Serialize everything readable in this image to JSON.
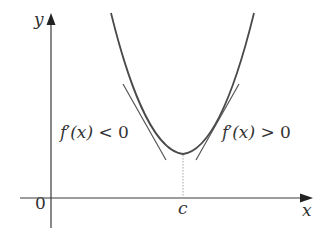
{
  "diagram": {
    "title": "",
    "axes": {
      "x_label": "x",
      "y_label": "y",
      "origin_label": "0",
      "x_tick_label": "c"
    },
    "annotations": {
      "left_region": {
        "prefix": "f",
        "prime": "′",
        "arg": "(x)",
        "relation": " < ",
        "value": "0"
      },
      "right_region": {
        "prefix": "f",
        "prime": "′",
        "arg": "(x)",
        "relation": " > ",
        "value": "0"
      }
    },
    "curve": {
      "description": "upward-opening parabola with minimum at x = c",
      "stroke_color": "#4a4a4a"
    },
    "tangent_lines": [
      {
        "side": "left",
        "slope_sign": "negative"
      },
      {
        "side": "right",
        "slope_sign": "positive"
      }
    ],
    "colors": {
      "axis": "#3a3a3a",
      "curve": "#4a4a4a",
      "tangent": "#555555",
      "dotted_guide": "#9a9a9a",
      "text": "#333333"
    }
  }
}
